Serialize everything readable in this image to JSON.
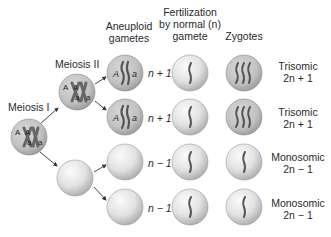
{
  "headers": {
    "aneuploid": [
      "Aneuploid",
      "gametes"
    ],
    "fertilization": [
      "Fertilization",
      "by normal (n)",
      "gamete"
    ],
    "zygotes": "Zygotes"
  },
  "stage_labels": {
    "meiosis_1": "Meiosis I",
    "meiosis_2": "Meiosis II"
  },
  "cells": {
    "meiosis_1_cell": {
      "alleles": [
        "A",
        "A",
        "a",
        "a"
      ]
    },
    "meiosis_2_cell": {
      "alleles": [
        "A",
        "A",
        "a",
        "a"
      ]
    },
    "meiosis_2_empty_cell": {
      "alleles": []
    }
  },
  "rows": [
    {
      "gamete_alleles": [
        "A",
        "a"
      ],
      "gamete_ploidy": "n + 1",
      "zygote_type": "Trisomic",
      "zygote_ploidy": "2n + 1"
    },
    {
      "gamete_alleles": [
        "A",
        "a"
      ],
      "gamete_ploidy": "n + 1",
      "zygote_type": "Trisomic",
      "zygote_ploidy": "2n + 1"
    },
    {
      "gamete_alleles": [],
      "gamete_ploidy": "n − 1",
      "zygote_type": "Monosomic",
      "zygote_ploidy": "2n − 1"
    },
    {
      "gamete_alleles": [],
      "gamete_ploidy": "n − 1",
      "zygote_type": "Monosomic",
      "zygote_ploidy": "2n − 1"
    }
  ],
  "colors": {
    "cell_fill_light": "#f4f4f4",
    "cell_fill_dark": "#a9a9a9",
    "chromosome": "#555555",
    "arrow": "#333333",
    "text": "#2a2a2a"
  }
}
